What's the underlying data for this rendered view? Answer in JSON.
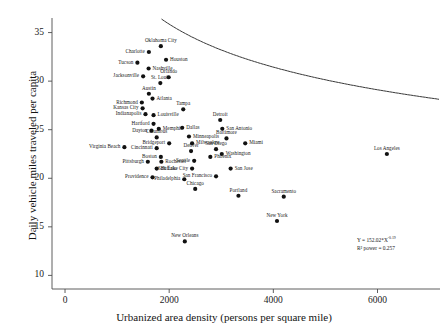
{
  "chart_data": {
    "type": "scatter",
    "title": "",
    "xlabel": "Urbanized area density (persons per square mile)",
    "ylabel": "Daily vehicle miles traveled per capita",
    "xlim": [
      -250,
      7200
    ],
    "ylim": [
      8.6,
      36.5
    ],
    "xticks": [
      0,
      2000,
      4000,
      6000
    ],
    "yticks": [
      10,
      15,
      20,
      25,
      30,
      35
    ],
    "xtick_labels": [
      "0",
      "2000",
      "4000",
      "6000"
    ],
    "ytick_labels": [
      "10",
      "15",
      "20",
      "25",
      "30",
      "35"
    ],
    "grid": false,
    "legend": false,
    "annotations": [
      {
        "name": "fit-equation",
        "text_line1": "Y = 152.02*X",
        "exponent": "-0.19",
        "text_line2": "R² power = 0.257"
      }
    ],
    "fit": {
      "form": "power",
      "coefficient": 152.02,
      "exponent": -0.19,
      "r2": 0.257,
      "curve_color": "#3a3a3a"
    },
    "marker_color": "#111111",
    "points": [
      {
        "label": "Oklahoma City",
        "x": 1840,
        "y": 33.6,
        "anchor": "t"
      },
      {
        "label": "Charlotte",
        "x": 1610,
        "y": 33.0,
        "anchor": "r"
      },
      {
        "label": "Houston",
        "x": 1940,
        "y": 32.2,
        "anchor": "l"
      },
      {
        "label": "Tucson",
        "x": 1390,
        "y": 31.9,
        "anchor": "r"
      },
      {
        "label": "Nashville",
        "x": 1605,
        "y": 31.3,
        "anchor": "l"
      },
      {
        "label": "Orlando",
        "x": 1990,
        "y": 30.4,
        "anchor": "t"
      },
      {
        "label": "Jacksonville",
        "x": 1500,
        "y": 30.5,
        "anchor": "r"
      },
      {
        "label": "St. Louis",
        "x": 1830,
        "y": 29.8,
        "anchor": "t"
      },
      {
        "label": "Austin",
        "x": 1610,
        "y": 28.7,
        "anchor": "t"
      },
      {
        "label": "Atlanta",
        "x": 1680,
        "y": 28.2,
        "anchor": "l"
      },
      {
        "label": "Richmond",
        "x": 1475,
        "y": 27.8,
        "anchor": "r"
      },
      {
        "label": "Kansas City",
        "x": 1490,
        "y": 27.2,
        "anchor": "r"
      },
      {
        "label": "Tampa",
        "x": 2270,
        "y": 27.1,
        "anchor": "t"
      },
      {
        "label": "Indianapolis",
        "x": 1545,
        "y": 26.6,
        "anchor": "r"
      },
      {
        "label": "Louisville",
        "x": 1700,
        "y": 26.5,
        "anchor": "l"
      },
      {
        "label": "Detroit",
        "x": 2980,
        "y": 26.0,
        "anchor": "t"
      },
      {
        "label": "Hartford",
        "x": 1700,
        "y": 25.6,
        "anchor": "r"
      },
      {
        "label": "Memphis",
        "x": 1800,
        "y": 25.1,
        "anchor": "l"
      },
      {
        "label": "Dallas",
        "x": 2250,
        "y": 25.2,
        "anchor": "l"
      },
      {
        "label": "San Antonio",
        "x": 3020,
        "y": 25.1,
        "anchor": "l"
      },
      {
        "label": "Dayton",
        "x": 1660,
        "y": 24.9,
        "anchor": "r"
      },
      {
        "label": "Minneapolis",
        "x": 2380,
        "y": 24.3,
        "anchor": "l"
      },
      {
        "label": "Columbus",
        "x": 1760,
        "y": 24.2,
        "anchor": "t"
      },
      {
        "label": "Baltimore",
        "x": 3100,
        "y": 24.1,
        "anchor": "t"
      },
      {
        "label": "Miami",
        "x": 3460,
        "y": 23.6,
        "anchor": "l"
      },
      {
        "label": "Bridgeport",
        "x": 2000,
        "y": 23.6,
        "anchor": "r"
      },
      {
        "label": "Milwaukee",
        "x": 2440,
        "y": 23.6,
        "anchor": "l"
      },
      {
        "label": "Cincinnati",
        "x": 1760,
        "y": 23.1,
        "anchor": "r"
      },
      {
        "label": "Virginia Beach",
        "x": 1140,
        "y": 23.2,
        "anchor": "r"
      },
      {
        "label": "San Diego",
        "x": 2900,
        "y": 23.0,
        "anchor": "t"
      },
      {
        "label": "Denver",
        "x": 2420,
        "y": 22.8,
        "anchor": "t"
      },
      {
        "label": "Washington",
        "x": 3010,
        "y": 22.5,
        "anchor": "l"
      },
      {
        "label": "Boston",
        "x": 1840,
        "y": 22.2,
        "anchor": "r"
      },
      {
        "label": "Phoenix",
        "x": 2790,
        "y": 22.2,
        "anchor": "l"
      },
      {
        "label": "Pittsburgh",
        "x": 1590,
        "y": 21.7,
        "anchor": "r"
      },
      {
        "label": "Rochester",
        "x": 1850,
        "y": 21.7,
        "anchor": "l"
      },
      {
        "label": "Seattle",
        "x": 2480,
        "y": 21.8,
        "anchor": "r"
      },
      {
        "label": "Buffalo",
        "x": 1760,
        "y": 21.0,
        "anchor": "l"
      },
      {
        "label": "Salt Lake City",
        "x": 2440,
        "y": 21.0,
        "anchor": "r"
      },
      {
        "label": "San Jose",
        "x": 3180,
        "y": 21.0,
        "anchor": "l"
      },
      {
        "label": "Providence",
        "x": 1680,
        "y": 20.1,
        "anchor": "r"
      },
      {
        "label": "Philadelphia",
        "x": 2290,
        "y": 19.9,
        "anchor": "r"
      },
      {
        "label": "San Francisco",
        "x": 2900,
        "y": 20.2,
        "anchor": "r"
      },
      {
        "label": "Chicago",
        "x": 2500,
        "y": 18.9,
        "anchor": "t"
      },
      {
        "label": "Los Angeles",
        "x": 6180,
        "y": 22.5,
        "anchor": "t"
      },
      {
        "label": "Portland",
        "x": 3330,
        "y": 18.2,
        "anchor": "t"
      },
      {
        "label": "Sacramento",
        "x": 4200,
        "y": 18.1,
        "anchor": "t"
      },
      {
        "label": "New York",
        "x": 4070,
        "y": 15.6,
        "anchor": "t"
      },
      {
        "label": "New Orleans",
        "x": 2300,
        "y": 13.5,
        "anchor": "t"
      }
    ]
  }
}
